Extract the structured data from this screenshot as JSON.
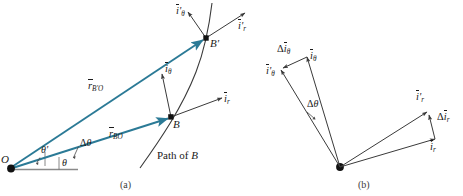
{
  "figure": {
    "panels": [
      {
        "id": "a",
        "caption": "(a)",
        "description": "Position vectors from O to B and B' with unit vectors"
      },
      {
        "id": "b",
        "caption": "(b)",
        "description": "Unit vector difference triangles"
      }
    ]
  },
  "colors": {
    "vector_teal": "#2b7a96",
    "line_black": "#3a3a3a",
    "text": "#1a1a1a",
    "caption": "#3b3b3b",
    "background": "#ffffff"
  },
  "panel_a": {
    "points": [
      {
        "name": "O",
        "label": "O",
        "italic": true
      },
      {
        "name": "B",
        "label": "B",
        "italic": true
      },
      {
        "name": "B-prime",
        "label": "B'",
        "italic": true
      }
    ],
    "vectors": [
      {
        "name": "r-BprimeO",
        "base": "r",
        "sub": "B'O",
        "overbar": true
      },
      {
        "name": "r-BO",
        "base": "r",
        "sub": "BO",
        "overbar": true
      }
    ],
    "unit_vectors": [
      {
        "name": "i-theta-prime",
        "base": "i",
        "prime": true,
        "sub": "θ",
        "overbar": true
      },
      {
        "name": "i-r-prime",
        "base": "i",
        "prime": true,
        "sub": "r",
        "overbar": true
      },
      {
        "name": "i-theta",
        "base": "i",
        "prime": false,
        "sub": "θ",
        "overbar": true
      },
      {
        "name": "i-r",
        "base": "i",
        "prime": false,
        "sub": "r",
        "overbar": true
      }
    ],
    "angles": [
      {
        "name": "theta-prime",
        "label": "θ'"
      },
      {
        "name": "delta-theta",
        "label": "Δθ"
      },
      {
        "name": "theta",
        "label": "θ"
      }
    ],
    "path_label": "Path of B",
    "path_label_plain": "Path of",
    "path_label_italic": "B",
    "caption": "(a)"
  },
  "panel_b": {
    "unit_vectors": [
      {
        "name": "delta-i-theta",
        "label_delta": "Δ",
        "base": "i",
        "sub": "θ",
        "overbar": true
      },
      {
        "name": "i-theta",
        "base": "i",
        "sub": "θ",
        "overbar": true
      },
      {
        "name": "i-theta-prime",
        "base": "i",
        "prime": true,
        "sub": "θ",
        "overbar": true
      },
      {
        "name": "i-r-prime",
        "base": "i",
        "prime": true,
        "sub": "r",
        "overbar": true
      },
      {
        "name": "delta-i-r",
        "label_delta": "Δ",
        "base": "i",
        "sub": "r",
        "overbar": true
      },
      {
        "name": "i-r",
        "base": "i",
        "sub": "r",
        "overbar": true
      }
    ],
    "angles": [
      {
        "name": "delta-theta",
        "label": "Δθ"
      }
    ],
    "caption": "(b)"
  },
  "text_tokens": {
    "i": "i",
    "r": "r",
    "theta": "θ",
    "prime": "'",
    "delta": "Δ",
    "sub_r": "r",
    "sub_theta": "θ",
    "sub_BO": "BO",
    "sub_BprimeO": "B'O",
    "O": "O",
    "B": "B",
    "Bprime": "B'",
    "path_of": "Path of",
    "B_italic": "B",
    "cap_a": "(a)",
    "cap_b": "(b)",
    "angle_theta": "θ",
    "angle_theta_prime": "θ'",
    "angle_delta_theta": "Δθ"
  }
}
